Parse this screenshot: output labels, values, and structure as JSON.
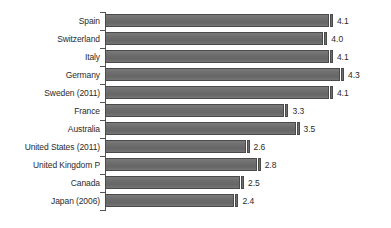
{
  "chart_data": {
    "type": "bar",
    "orientation": "horizontal",
    "title": "",
    "subtitle": "",
    "xlabel": "",
    "ylabel": "",
    "categories": [
      "Spain",
      "Switzerland",
      "Italy",
      "Germany",
      "Sweden (2011)",
      "France",
      "Australia",
      "United States (2011)",
      "United Kingdom P",
      "Canada",
      "Japan (2006)"
    ],
    "values": [
      4.1,
      4.0,
      4.1,
      4.3,
      4.1,
      3.3,
      3.5,
      2.6,
      2.8,
      2.5,
      2.4
    ],
    "value_labels": [
      "4.1",
      "4.0",
      "4.1",
      "4.3",
      "4.1",
      "3.3",
      "3.5",
      "2.6",
      "2.8",
      "2.5",
      "2.4"
    ],
    "xlim": [
      0,
      4.3
    ],
    "grid": false,
    "legend": null,
    "legend_position": "none",
    "series": [
      {
        "name": "",
        "values": [
          4.1,
          4.0,
          4.1,
          4.3,
          4.1,
          3.3,
          3.5,
          2.6,
          2.8,
          2.5,
          2.4
        ]
      }
    ],
    "colors": {
      "bar_fill": "#6e6e6e",
      "bar_outline": "#4a4a4a",
      "axis": "#555555",
      "text": "#2b2b2b",
      "background": "#ffffff"
    }
  }
}
